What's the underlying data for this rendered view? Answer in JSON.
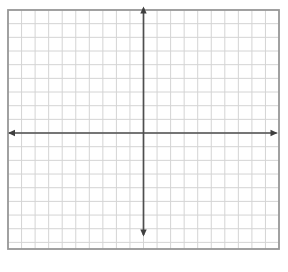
{
  "figure": {
    "canvas": {
      "width": 288,
      "height": 272,
      "background": "#ffffff"
    },
    "grid": {
      "left": 8,
      "top": 10,
      "right": 279,
      "bottom": 249,
      "cols": 20,
      "row_spacing": 13.67,
      "row_lines": 17,
      "line_color": "#d4d4d4",
      "line_width": 1,
      "border_color": "#979797",
      "border_width": 1.8
    },
    "axes": {
      "color": "#4e4e4e",
      "stroke_width": 1.7,
      "arrow_color": "#3f3f3f",
      "arrow_length": 7,
      "arrow_halfwidth": 3.2,
      "x_axis": {
        "y": 133,
        "from": 9,
        "to": 276.5,
        "tip_left": 8,
        "tip_right": 277.5
      },
      "y_axis": {
        "x": 143.5,
        "from": 8.5,
        "to": 235,
        "tip_top": 6.5,
        "tip_bottom": 236.5
      }
    }
  },
  "chart_data": {
    "type": "scatter",
    "series": [],
    "title": "",
    "xlabel": "",
    "ylabel": "",
    "xlim": [
      -10,
      10
    ],
    "ylim": [
      -8.5,
      9
    ],
    "x_tick_spacing": 1,
    "y_tick_spacing": 1,
    "grid": true,
    "tick_labels": false,
    "legend": false,
    "annotations": []
  }
}
